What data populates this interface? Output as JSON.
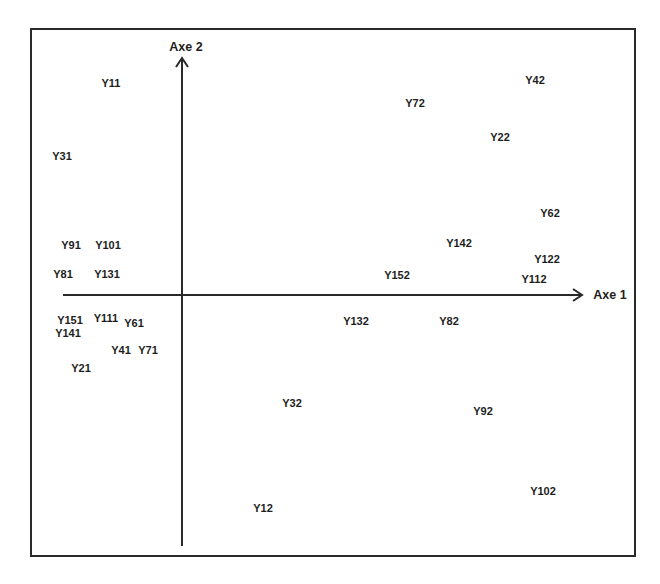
{
  "chart_data": {
    "type": "scatter",
    "title": "",
    "xlabel": "Axe 1",
    "ylabel": "Axe 2",
    "grid": false,
    "legend": null,
    "axes": {
      "origin_px": {
        "x": 182,
        "y": 295
      },
      "x_axis": {
        "from_px": 63,
        "to_px": 582,
        "arrow": true
      },
      "y_axis": {
        "from_px": 546,
        "to_px": 58,
        "arrow": true
      }
    },
    "note": "Labelled point map (correspondence-analysis style); coordinates are relative to the axis origin in pixel units (x right positive, y up positive).",
    "points": [
      {
        "label": "Y11",
        "x": -71,
        "y": 212
      },
      {
        "label": "Y31",
        "x": -120,
        "y": 139
      },
      {
        "label": "Y91",
        "x": -111,
        "y": 50
      },
      {
        "label": "Y101",
        "x": -74,
        "y": 50
      },
      {
        "label": "Y81",
        "x": -119,
        "y": 21
      },
      {
        "label": "Y131",
        "x": -75,
        "y": 21
      },
      {
        "label": "Y151",
        "x": -112,
        "y": -25
      },
      {
        "label": "Y111",
        "x": -76,
        "y": -23
      },
      {
        "label": "Y61",
        "x": -48,
        "y": -28
      },
      {
        "label": "Y141",
        "x": -114,
        "y": -38
      },
      {
        "label": "Y41",
        "x": -61,
        "y": -55
      },
      {
        "label": "Y71",
        "x": -34,
        "y": -55
      },
      {
        "label": "Y21",
        "x": -101,
        "y": -73
      },
      {
        "label": "Y72",
        "x": 233,
        "y": 192
      },
      {
        "label": "Y42",
        "x": 353,
        "y": 215
      },
      {
        "label": "Y22",
        "x": 318,
        "y": 158
      },
      {
        "label": "Y62",
        "x": 368,
        "y": 82
      },
      {
        "label": "Y142",
        "x": 277,
        "y": 52
      },
      {
        "label": "Y122",
        "x": 365,
        "y": 36
      },
      {
        "label": "Y112",
        "x": 352,
        "y": 16
      },
      {
        "label": "Y152",
        "x": 215,
        "y": 20
      },
      {
        "label": "Y132",
        "x": 174,
        "y": -26
      },
      {
        "label": "Y82",
        "x": 267,
        "y": -26
      },
      {
        "label": "Y32",
        "x": 110,
        "y": -108
      },
      {
        "label": "Y92",
        "x": 301,
        "y": -116
      },
      {
        "label": "Y12",
        "x": 81,
        "y": -213
      },
      {
        "label": "Y102",
        "x": 361,
        "y": -196
      }
    ]
  },
  "labels": {
    "axis1": "Axe 1",
    "axis2": "Axe 2"
  },
  "colors": {
    "ink": "#1e1e1e",
    "background": "#ffffff"
  }
}
